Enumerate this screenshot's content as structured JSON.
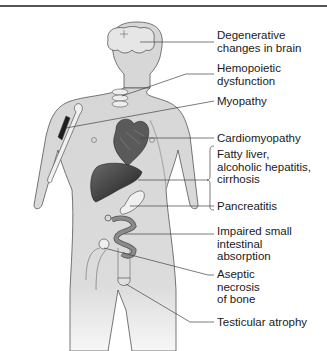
{
  "diagram": {
    "type": "anatomical-callout",
    "colors": {
      "body_fill": "#d9d9d9",
      "body_outline": "#555555",
      "organ_dark": "#3a3a3a",
      "leader_line": "#444444",
      "text": "#1a1a1a"
    },
    "labels": [
      {
        "id": "brain",
        "text": "Degenerative\nchanges in brain",
        "target": "brain"
      },
      {
        "id": "hemopoietic",
        "text": "Hemopoietic\ndysfunction",
        "target": "spine / bone marrow"
      },
      {
        "id": "myopathy",
        "text": "Myopathy",
        "target": "upper arm muscle"
      },
      {
        "id": "cardio",
        "text": "Cardiomyopathy",
        "target": "heart"
      },
      {
        "id": "liver",
        "text": "Fatty liver,\nalcoholic hepatitis,\ncirrhosis",
        "target": "liver"
      },
      {
        "id": "pancreas",
        "text": "Pancreatitis",
        "target": "pancreas"
      },
      {
        "id": "intestine",
        "text": "Impaired small\nintestinal\nabsorption",
        "target": "small intestine"
      },
      {
        "id": "bone",
        "text": "Aseptic\nnecrosis\nof bone",
        "target": "femoral head"
      },
      {
        "id": "testes",
        "text": "Testicular atrophy",
        "target": "testes"
      }
    ]
  }
}
